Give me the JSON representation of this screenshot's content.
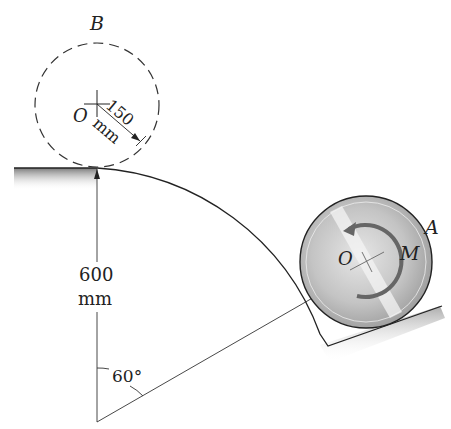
{
  "diagram": {
    "labels": {
      "position_B": "B",
      "position_A": "A",
      "center_B": "O",
      "center_A": "O",
      "moment": "M",
      "radius_value": "150",
      "radius_unit": "mm",
      "height_value": "600",
      "height_unit": "mm",
      "angle": "60°"
    },
    "elements": {
      "surface": "curved track with shaded edge",
      "disc_B": "dashed circle (initial position)",
      "disc_A": "solid metallic disc (current position)",
      "moment_arrow": "counterclockwise curved arrow"
    },
    "colors": {
      "line": "#222222",
      "shade": "#8a8a8a",
      "disc_fill": "#c8c8c8",
      "background": "#ffffff"
    }
  }
}
